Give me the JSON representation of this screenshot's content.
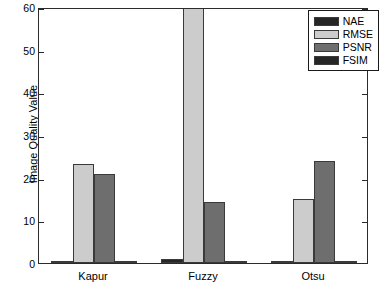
{
  "chart_data": {
    "type": "bar",
    "title": "",
    "xlabel": "",
    "ylabel": "Image Quality Value",
    "categories": [
      "Kapur",
      "Fuzzy",
      "Otsu"
    ],
    "ylim": [
      0,
      60
    ],
    "yticks": [
      0,
      10,
      20,
      30,
      40,
      50,
      60
    ],
    "ytick_labels": [
      "0",
      "10",
      "20",
      "30",
      "40",
      "50",
      "60"
    ],
    "grid": false,
    "legend_position": "top-right",
    "series": [
      {
        "name": "NAE",
        "color": "#262626",
        "values": [
          0.4,
          0.85,
          0.3
        ]
      },
      {
        "name": "RMSE",
        "color": "#cccccc",
        "values": [
          23.2,
          62,
          15.1
        ]
      },
      {
        "name": "PSNR",
        "color": "#6e6e6e",
        "values": [
          20.8,
          14.2,
          24.0
        ]
      },
      {
        "name": "FSIM",
        "color": "#262626",
        "values": [
          0.55,
          0.5,
          0.5
        ]
      }
    ]
  }
}
